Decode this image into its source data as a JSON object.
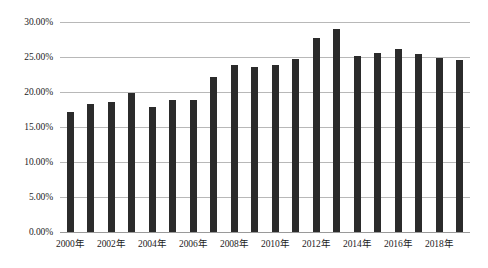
{
  "chart_data": {
    "type": "bar",
    "title": "",
    "xlabel": "",
    "ylabel": "",
    "categories": [
      "2000年",
      "2001年",
      "2002年",
      "2003年",
      "2004年",
      "2005年",
      "2006年",
      "2007年",
      "2008年",
      "2009年",
      "2010年",
      "2011年",
      "2012年",
      "2013年",
      "2014年",
      "2015年",
      "2016年",
      "2017年",
      "2018年",
      "2019年"
    ],
    "values": [
      17.2,
      18.3,
      18.6,
      19.8,
      17.9,
      18.8,
      18.8,
      22.1,
      23.9,
      23.6,
      23.9,
      24.7,
      27.7,
      29.0,
      25.2,
      25.6,
      26.1,
      25.5,
      24.8,
      24.6
    ],
    "ylim": [
      0,
      30
    ],
    "ytick_values": [
      0,
      5,
      10,
      15,
      20,
      25,
      30
    ],
    "ytick_labels": [
      "0.00%",
      "5.00%",
      "10.00%",
      "15.00%",
      "20.00%",
      "25.00%",
      "30.00%"
    ],
    "xtick_labels": [
      "2000年",
      "2002年",
      "2004年",
      "2006年",
      "2008年",
      "2010年",
      "2012年",
      "2014年",
      "2016年",
      "2018年"
    ],
    "xtick_indices": [
      0,
      2,
      4,
      6,
      8,
      10,
      12,
      14,
      16,
      18
    ],
    "grid": true,
    "legend": false,
    "series": [
      {
        "name": "",
        "values": [
          17.2,
          18.3,
          18.6,
          19.8,
          17.9,
          18.8,
          18.8,
          22.1,
          23.9,
          23.6,
          23.9,
          24.7,
          27.7,
          29.0,
          25.2,
          25.6,
          26.1,
          25.5,
          24.8,
          24.6
        ]
      }
    ],
    "colors": {
      "bar": "#2b2b2b",
      "gridline": "#b8b8b8",
      "baseline": "#9a9a9a",
      "background": "#ffffff",
      "text": "#1c1c1c"
    }
  }
}
